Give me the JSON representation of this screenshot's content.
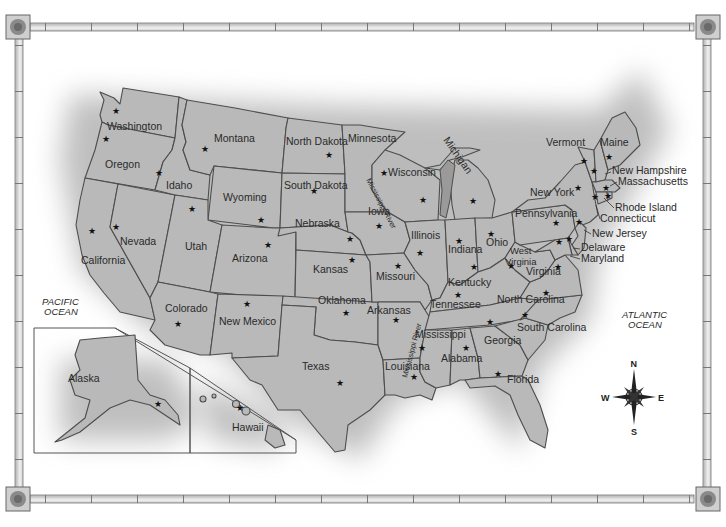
{
  "map": {
    "title": "United States",
    "oceans": [
      {
        "label_line1": "PACIFIC",
        "label_line2": "OCEAN"
      },
      {
        "label_line1": "ATLANTIC",
        "label_line2": "OCEAN"
      }
    ],
    "rivers": [
      "Mississippi River",
      "Mississippi River"
    ],
    "lakes": [
      "Michigan"
    ],
    "compass": {
      "n": "N",
      "s": "S",
      "e": "E",
      "w": "W"
    },
    "states": [
      "Washington",
      "Oregon",
      "California",
      "Idaho",
      "Nevada",
      "Montana",
      "Wyoming",
      "Utah",
      "Arizona",
      "Colorado",
      "New Mexico",
      "North Dakota",
      "South Dakota",
      "Nebraska",
      "Kansas",
      "Oklahoma",
      "Texas",
      "Minnesota",
      "Iowa",
      "Missouri",
      "Arkansas",
      "Louisiana",
      "Wisconsin",
      "Illinois",
      "Michigan",
      "Indiana",
      "Ohio",
      "Kentucky",
      "Tennessee",
      "Mississippi",
      "Alabama",
      "Georgia",
      "Florida",
      "South Carolina",
      "North Carolina",
      "Virginia",
      "West",
      "Virginia",
      "Pennsylvania",
      "New York",
      "Vermont",
      "Maine",
      "New Hampshire",
      "Massachusetts",
      "Rhode Island",
      "Connecticut",
      "New Jersey",
      "Delaware",
      "Maryland",
      "Alaska",
      "Hawaii"
    ],
    "star_glyph": "★"
  }
}
